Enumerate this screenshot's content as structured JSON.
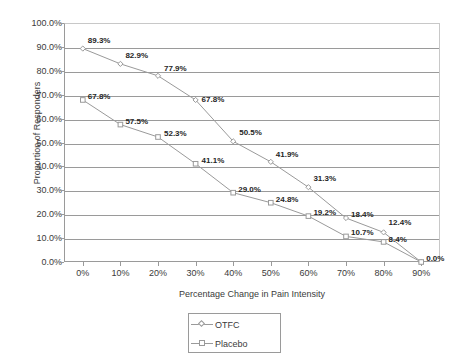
{
  "chart_data": {
    "type": "line",
    "title": "",
    "xlabel": "Percentage Change in Pain Intensity",
    "ylabel": "Proportion of Responders",
    "x": [
      0,
      10,
      20,
      30,
      40,
      50,
      60,
      70,
      80,
      90
    ],
    "xtick_labels": [
      "0%",
      "10%",
      "20%",
      "30%",
      "40%",
      "50%",
      "60%",
      "70%",
      "80%",
      "90%"
    ],
    "ytick_labels": [
      "0.0%",
      "10.0%",
      "20.0%",
      "30.0%",
      "40.0%",
      "50.0%",
      "60.0%",
      "70.0%",
      "80.0%",
      "90.0%",
      "100.0%"
    ],
    "ylim": [
      0,
      100
    ],
    "xlim": [
      -5,
      95
    ],
    "grid": "horizontal",
    "legend_position": "bottom-center",
    "series": [
      {
        "name": "OTFC",
        "marker": "diamond",
        "color": "#9a9a9a",
        "values": [
          89.3,
          82.9,
          77.9,
          67.8,
          50.5,
          41.9,
          31.3,
          18.4,
          12.4,
          0.0
        ],
        "data_labels": [
          "89.3%",
          "82.9%",
          "77.9%",
          "67.8%",
          "50.5%",
          "41.9%",
          "31.3%",
          "18.4%",
          "12.4%",
          "0.0%"
        ]
      },
      {
        "name": "Placebo",
        "marker": "square",
        "color": "#9a9a9a",
        "values": [
          67.8,
          57.5,
          52.3,
          41.1,
          29.0,
          24.8,
          19.2,
          10.7,
          8.4,
          0.0
        ],
        "data_labels": [
          "67.8%",
          "57.5%",
          "52.3%",
          "41.1%",
          "29.0%",
          "24.8%",
          "19.2%",
          "10.7%",
          "8.4%",
          "0.0%"
        ]
      }
    ]
  },
  "legend": {
    "entries": [
      {
        "label": "OTFC"
      },
      {
        "label": "Placebo"
      }
    ]
  },
  "colors": {
    "line": "#9a9a9a",
    "axis": "#9a9a9a",
    "grid": "#9a9a9a",
    "text": "#3b3b3b",
    "label_text": "#262626",
    "background": "#ffffff"
  }
}
